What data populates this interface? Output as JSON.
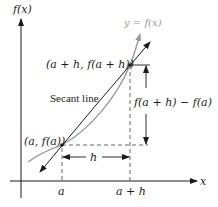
{
  "diagram": {
    "axes": {
      "y_label": "f(x)",
      "x_label": "x"
    },
    "curve": {
      "label": "y = f(x)",
      "color": "#9a9a9a"
    },
    "secant": {
      "label": "Secant line",
      "color": "#1a1a1a"
    },
    "points": [
      {
        "label": "(a, f(a))"
      },
      {
        "label": "(a + h, f(a + h))"
      }
    ],
    "x_ticks": [
      {
        "label": "a"
      },
      {
        "label": "a + h"
      }
    ],
    "horizontal_distance_label": "h",
    "vertical_distance_label": "f(a + h) − f(a)"
  }
}
